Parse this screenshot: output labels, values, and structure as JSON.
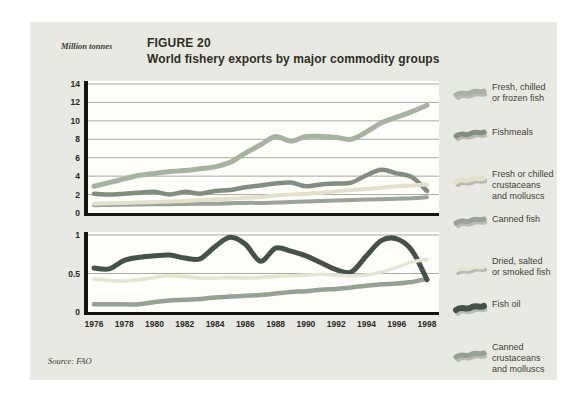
{
  "figure": {
    "units_label": "Million tonnes",
    "title": "FIGURE 20",
    "subtitle": "World fishery exports by major commodity groups",
    "source": "Source: FAO"
  },
  "palette": {
    "panel_bg": "#e9e9e4",
    "plot_bg": "#fdfdfa",
    "grid": "#a9aba1",
    "axis": "#14140f",
    "tick_text": "#2b2b23"
  },
  "legend": [
    {
      "label": "Fresh, chilled or frozen fish",
      "lines": [
        "Fresh, chilled",
        "or frozen fish"
      ],
      "color": "#a8b2a0"
    },
    {
      "label": "Fishmeals",
      "lines": [
        "Fishmeals"
      ],
      "color": "#828d7f"
    },
    {
      "label": "Fresh or chilled crustaceans and molluscs",
      "lines": [
        "Fresh or chilled",
        "crustaceans",
        "and molluscs"
      ],
      "color": "#e3e1cb"
    },
    {
      "label": "Canned fish",
      "lines": [
        "Canned fish"
      ],
      "color": "#9ba29a"
    },
    {
      "label": "Dried, salted or smoked fish",
      "lines": [
        "Dried, salted",
        "or smoked fish"
      ],
      "color": "#e6e4d3"
    },
    {
      "label": "Fish oil",
      "lines": [
        "Fish oil"
      ],
      "color": "#45524a"
    },
    {
      "label": "Canned crustaceans and molluscs",
      "lines": [
        "Canned",
        "crustaceans",
        "and molluscs"
      ],
      "color": "#96a093"
    }
  ],
  "chart_data": [
    {
      "type": "line",
      "title": "World fishery exports by major commodity groups (upper panel)",
      "ylabel": "Million tonnes",
      "x": [
        1976,
        1977,
        1978,
        1979,
        1980,
        1981,
        1982,
        1983,
        1984,
        1985,
        1986,
        1987,
        1988,
        1989,
        1990,
        1991,
        1992,
        1993,
        1994,
        1995,
        1996,
        1997,
        1998
      ],
      "ylim": [
        0,
        14
      ],
      "y_ticks": [
        0,
        2,
        4,
        6,
        8,
        10,
        12,
        14
      ],
      "grid": "horizontal",
      "legend_position": "right",
      "series": [
        {
          "name": "Fresh, chilled or frozen fish",
          "color": "#a8b2a0",
          "values": [
            2.9,
            3.3,
            3.7,
            4.1,
            4.3,
            4.5,
            4.6,
            4.8,
            5.0,
            5.5,
            6.5,
            7.4,
            8.3,
            7.8,
            8.3,
            8.3,
            8.2,
            8.0,
            8.8,
            9.8,
            10.4,
            11.0,
            11.7
          ]
        },
        {
          "name": "Fishmeals",
          "color": "#828d7f",
          "values": [
            2.1,
            2.0,
            2.1,
            2.2,
            2.3,
            2.0,
            2.3,
            2.1,
            2.4,
            2.5,
            2.8,
            3.0,
            3.2,
            3.3,
            2.9,
            3.1,
            3.2,
            3.3,
            4.1,
            4.7,
            4.3,
            3.9,
            2.4
          ]
        },
        {
          "name": "Fresh or chilled crustaceans and molluscs",
          "color": "#e3e1cb",
          "values": [
            1.0,
            1.05,
            1.1,
            1.15,
            1.2,
            1.25,
            1.3,
            1.4,
            1.5,
            1.55,
            1.65,
            1.75,
            1.9,
            2.0,
            2.1,
            2.2,
            2.35,
            2.5,
            2.6,
            2.75,
            2.9,
            3.0,
            3.1
          ]
        },
        {
          "name": "Canned fish",
          "color": "#9ba29a",
          "values": [
            0.85,
            0.87,
            0.9,
            0.92,
            0.95,
            0.95,
            0.98,
            1.0,
            1.0,
            1.05,
            1.1,
            1.1,
            1.15,
            1.2,
            1.25,
            1.3,
            1.35,
            1.4,
            1.45,
            1.5,
            1.55,
            1.6,
            1.7
          ]
        }
      ]
    },
    {
      "type": "line",
      "title": "World fishery exports by major commodity groups (lower panel)",
      "ylabel": "Million tonnes",
      "x": [
        1976,
        1977,
        1978,
        1979,
        1980,
        1981,
        1982,
        1983,
        1984,
        1985,
        1986,
        1987,
        1988,
        1989,
        1990,
        1991,
        1992,
        1993,
        1994,
        1995,
        1996,
        1997,
        1998
      ],
      "x_tick_labels": [
        "1976",
        "1978",
        "1980",
        "1982",
        "1984",
        "1986",
        "1988",
        "1990",
        "1992",
        "1994",
        "1996",
        "1998"
      ],
      "ylim": [
        0,
        1
      ],
      "y_ticks": [
        0,
        0.5,
        1
      ],
      "grid": "horizontal",
      "series": [
        {
          "name": "Dried, salted or smoked fish",
          "color": "#e6e4d3",
          "values": [
            0.43,
            0.41,
            0.4,
            0.42,
            0.45,
            0.47,
            0.46,
            0.44,
            0.44,
            0.45,
            0.44,
            0.45,
            0.46,
            0.47,
            0.48,
            0.49,
            0.48,
            0.47,
            0.48,
            0.52,
            0.58,
            0.65,
            0.68
          ]
        },
        {
          "name": "Fish oil",
          "color": "#45524a",
          "values": [
            0.57,
            0.56,
            0.67,
            0.71,
            0.73,
            0.74,
            0.7,
            0.69,
            0.85,
            0.97,
            0.88,
            0.66,
            0.83,
            0.79,
            0.73,
            0.64,
            0.55,
            0.52,
            0.73,
            0.93,
            0.95,
            0.8,
            0.42
          ]
        },
        {
          "name": "Canned crustaceans and molluscs",
          "color": "#96a093",
          "values": [
            0.1,
            0.1,
            0.1,
            0.1,
            0.13,
            0.15,
            0.16,
            0.17,
            0.19,
            0.2,
            0.21,
            0.22,
            0.24,
            0.26,
            0.27,
            0.29,
            0.3,
            0.32,
            0.34,
            0.36,
            0.37,
            0.39,
            0.43
          ]
        }
      ]
    }
  ]
}
